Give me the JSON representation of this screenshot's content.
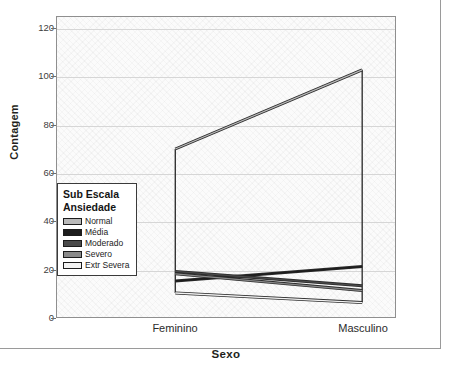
{
  "chart_data": {
    "type": "line",
    "title": "",
    "xlabel": "Sexo",
    "ylabel": "Contagem",
    "categories": [
      "Feminino",
      "Masculino"
    ],
    "ylim": [
      0,
      125
    ],
    "yticks": [
      0,
      20,
      40,
      60,
      80,
      100,
      120
    ],
    "grid": true,
    "legend_position": "inside-left",
    "legend_title_line1": "Sub Escala",
    "legend_title_line2": "Ansiedade",
    "series": [
      {
        "name": "Normal",
        "color": "#b9b9b9",
        "values": [
          70,
          103
        ]
      },
      {
        "name": "Média",
        "color": "#1d1d1d",
        "values": [
          15,
          21
        ]
      },
      {
        "name": "Moderado",
        "color": "#4a4a4a",
        "values": [
          19,
          13
        ]
      },
      {
        "name": "Severo",
        "color": "#8a8a8a",
        "values": [
          18,
          11
        ]
      },
      {
        "name": "Extr Severa",
        "color": "#f2f2f2",
        "values": [
          10,
          6
        ]
      }
    ]
  },
  "axes": {
    "y_title": "Contagem",
    "x_title": "Sexo",
    "y_tick_labels": [
      "120",
      "100",
      "80",
      "60",
      "40",
      "20",
      "0"
    ],
    "x_tick_labels": [
      "Feminino",
      "Masculino"
    ]
  },
  "legend": {
    "title_line1": "Sub Escala",
    "title_line2": "Ansiedade",
    "items": [
      {
        "label": "Normal"
      },
      {
        "label": "Média"
      },
      {
        "label": "Moderado"
      },
      {
        "label": "Severo"
      },
      {
        "label": "Extr Severa"
      }
    ]
  }
}
